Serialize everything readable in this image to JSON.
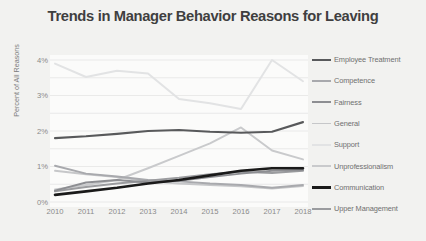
{
  "chart_data": {
    "type": "line",
    "title": "Trends in Manager Behavior Reasons for Leaving",
    "xlabel": "",
    "ylabel": "Percent of All Reasons",
    "x": [
      "2010",
      "2011",
      "2012",
      "2013",
      "2014",
      "2015",
      "2016",
      "2017",
      "2018"
    ],
    "ytick_labels": [
      "0%",
      "1%",
      "2%",
      "3%",
      "4%"
    ],
    "ytick_values": [
      0,
      1,
      2,
      3,
      4
    ],
    "ylim": [
      0,
      4
    ],
    "grid": true,
    "legend_position": "right",
    "value_suffix": "%",
    "series": [
      {
        "name": "Employee Treatment",
        "color": "#58595b",
        "width": 2.1,
        "values": [
          1.8,
          1.85,
          1.92,
          2.0,
          2.03,
          1.98,
          1.95,
          1.98,
          2.25
        ]
      },
      {
        "name": "Competence",
        "color": "#a8a9ad",
        "width": 1.9,
        "values": [
          1.02,
          0.8,
          0.72,
          0.62,
          0.58,
          0.52,
          0.48,
          0.4,
          0.48
        ]
      },
      {
        "name": "Fairness",
        "color": "#8d8e92",
        "width": 1.9,
        "values": [
          0.32,
          0.55,
          0.62,
          0.55,
          0.6,
          0.7,
          0.8,
          0.88,
          0.9
        ]
      },
      {
        "name": "General",
        "color": "#c6c7c9",
        "width": 1.9,
        "values": [
          0.88,
          0.78,
          0.7,
          0.58,
          0.52,
          0.48,
          0.44,
          0.38,
          0.45
        ]
      },
      {
        "name": "Support",
        "color": "#e2e3e4",
        "width": 2.0,
        "values": [
          3.9,
          3.52,
          3.7,
          3.62,
          2.9,
          2.78,
          2.62,
          4.0,
          3.4
        ]
      },
      {
        "name": "Unprofessionalism",
        "color": "#c9cacc",
        "width": 2.0,
        "values": [
          0.35,
          0.48,
          0.62,
          0.95,
          1.3,
          1.65,
          2.1,
          1.45,
          1.2
        ]
      },
      {
        "name": "Communication",
        "color": "#1a1a1a",
        "width": 2.6,
        "values": [
          0.2,
          0.3,
          0.4,
          0.52,
          0.62,
          0.75,
          0.88,
          0.95,
          0.95
        ]
      },
      {
        "name": "Upper Management",
        "color": "#9b9c9f",
        "width": 2.0,
        "values": [
          0.3,
          0.42,
          0.52,
          0.6,
          0.68,
          0.78,
          0.85,
          0.82,
          0.88
        ]
      }
    ]
  },
  "style": {
    "background": "#f2f2f0",
    "plot_background": "#fbfbfa",
    "grid_color": "#e6e6e4",
    "title_color": "#3f3f3f",
    "tick_color": "#8a8a8a",
    "axis_label_color": "#7c7c7c"
  },
  "plot_geometry": {
    "left": 55,
    "right": 303,
    "top": 60,
    "bottom": 202
  }
}
